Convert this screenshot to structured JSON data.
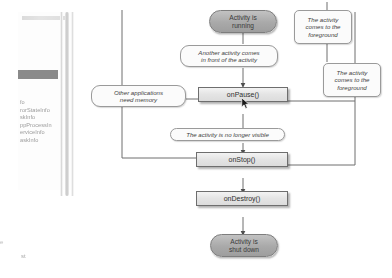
{
  "window": {
    "title": "Android activity lifecycle diagram"
  },
  "left_pane": {
    "title_blurred": "",
    "selected_item": "",
    "list_items": [
      "fo",
      "rorStateInfo",
      "skInfo",
      "ppProcessIn",
      "erviceInfo",
      "askInfo"
    ],
    "bottom_marker": "e",
    "status_text": "st"
  },
  "diagram": {
    "nodes": {
      "activity_running": "Activity is\nrunning",
      "on_pause": "onPause()",
      "on_stop": "onStop()",
      "on_destroy": "onDestroy()",
      "activity_shut_down": "Activity is\nshut down"
    },
    "callouts": {
      "foreground_top": "The activity\ncomes to the\nforeground",
      "another_activity": "Another activity comes\nin front of the activity",
      "foreground_right": "The activity\ncomes to the\nforeground",
      "need_memory": "Other applications\nneed memory",
      "no_longer_visible": "The activity is no longer visible"
    },
    "colors": {
      "pill_fill": "#a9a9a9",
      "pill_border": "#7d7d7d",
      "method_fill": "#e4e4e4",
      "method_border": "#6e6e6e",
      "callout_fill": "#fbfbfb",
      "callout_border": "#9a9a9a",
      "connector": "#6f6f6f"
    }
  }
}
